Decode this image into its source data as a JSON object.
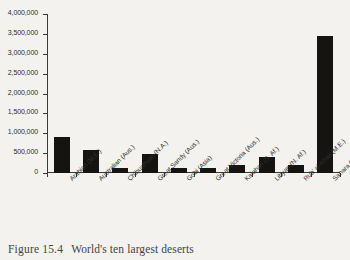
{
  "figure": {
    "caption_label": "Figure",
    "caption_number": "15.4",
    "caption_text": "World's ten largest deserts"
  },
  "chart_data": {
    "type": "bar",
    "title": "",
    "xlabel": "",
    "ylabel": "",
    "ylim": [
      0,
      4000000
    ],
    "grid": false,
    "legend": "none",
    "categories": [
      "Arabian (M.E.)",
      "Australian (Aus.)",
      "Chihuahuan (N.A.)",
      "Great Sandy (Aus.)",
      "Gobi (Asia)",
      "Great Victoria (Aus.)",
      "Kalahari (S. Af.)",
      "Libyan (N. Af.)",
      "Rub' al-Khali (M.E.)",
      "Sahara (N. Af.)"
    ],
    "values": [
      900000,
      590000,
      130000,
      480000,
      130000,
      120000,
      190000,
      400000,
      200000,
      3440000
    ],
    "ytick_labels": [
      "0",
      "500,000",
      "1,000,000",
      "1,500,000",
      "2,000,000",
      "2,500,000",
      "3,000,000",
      "3,500,000",
      "4,000,000"
    ],
    "ytick_values": [
      0,
      500000,
      1000000,
      1500000,
      2000000,
      2500000,
      3000000,
      3500000,
      4000000
    ],
    "bar_color": "#151413",
    "axis_color": "#3b3a38",
    "background_color": "#f3f2ef"
  }
}
